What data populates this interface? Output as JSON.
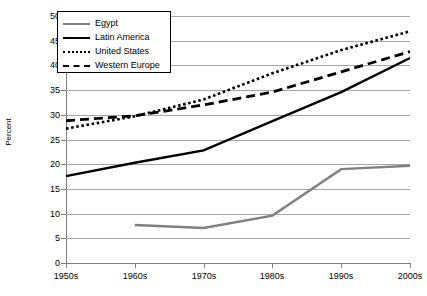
{
  "chart_data": {
    "type": "line",
    "title": "",
    "subtitle": "",
    "xlabel": "",
    "ylabel": "Percent",
    "categories": [
      "1950s",
      "1960s",
      "1970s",
      "1980s",
      "1990s",
      "2000s"
    ],
    "ylim": [
      0,
      50
    ],
    "ytick_step": 5,
    "yticks": [
      "0",
      "5",
      "10",
      "15",
      "20",
      "25",
      "30",
      "35",
      "40",
      "45",
      "50"
    ],
    "grid": "horizontal",
    "legend_position": "top-left-inside",
    "series": [
      {
        "name": "Egypt",
        "color": "#808080",
        "style": "solid",
        "x": [
          "1960s",
          "1970s",
          "1980s",
          "1990s",
          "2000s"
        ],
        "values": [
          7.7,
          7.1,
          9.6,
          19.0,
          19.7
        ]
      },
      {
        "name": "Latin America",
        "color": "#000000",
        "style": "solid",
        "x": [
          "1950s",
          "1960s",
          "1970s",
          "1980s",
          "1990s",
          "2000s"
        ],
        "values": [
          17.6,
          20.3,
          22.8,
          28.7,
          34.6,
          41.5
        ]
      },
      {
        "name": "United States",
        "color": "#000000",
        "style": "dotted",
        "x": [
          "1950s",
          "1960s",
          "1970s",
          "1980s",
          "1990s",
          "2000s"
        ],
        "values": [
          27.2,
          29.7,
          33.1,
          38.4,
          43.1,
          46.9
        ]
      },
      {
        "name": "Western Europe",
        "color": "#000000",
        "style": "dashed",
        "x": [
          "1950s",
          "1960s",
          "1970s",
          "1980s",
          "1990s",
          "2000s"
        ],
        "values": [
          28.8,
          29.8,
          32.0,
          34.6,
          38.7,
          42.8
        ]
      }
    ]
  },
  "legend": {
    "items": [
      {
        "label": "Egypt"
      },
      {
        "label": "Latin America"
      },
      {
        "label": "United States"
      },
      {
        "label": "Western Europe"
      }
    ]
  },
  "axes": {
    "y_title": "Percent"
  }
}
